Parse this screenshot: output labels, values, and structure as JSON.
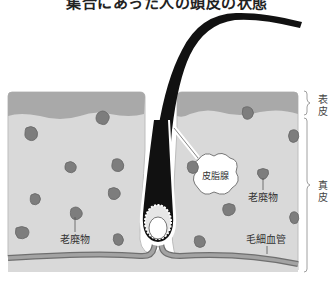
{
  "title": "集合にあった人の頭皮の状態",
  "labels": {
    "sebaceous_gland": "皮脂腺",
    "waste_upper": "老廃物",
    "waste_lower": "老廃物",
    "capillary": "毛細血管"
  },
  "layers": {
    "epidermis": "表皮",
    "dermis": "真皮"
  },
  "colors": {
    "epidermis": "#a9a9a9",
    "dermis": "#d9d9d9",
    "waste": "#7d7d7d",
    "hair": "#111111",
    "capillary": "#8c8c8c"
  }
}
